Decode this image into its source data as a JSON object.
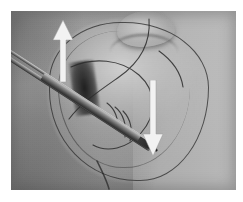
{
  "figure": {
    "kind": "clinical-surgical-photograph",
    "palette": "grayscale",
    "caption": "",
    "plate": {
      "border_color": "#ffffff",
      "x": 11,
      "y": 11,
      "width": 225,
      "height": 179
    }
  },
  "scene": {
    "subject": "breast",
    "view": "oblique intraoperative view",
    "background_label": "surgical drape",
    "regions": [
      {
        "name": "breast-mound",
        "tone": "#bdbdbd"
      },
      {
        "name": "nipple-areola",
        "tone": "#cecece"
      },
      {
        "name": "chest-wall-shadow",
        "tone": "#6e6e6e"
      },
      {
        "name": "axilla-shadow",
        "tone": "#656565"
      },
      {
        "name": "incision-pocket",
        "tone": "#1c1c1c"
      },
      {
        "name": "drape-right",
        "tone": "#bfbfbf"
      }
    ]
  },
  "instrument": {
    "name": "surgical-forceps",
    "label": "forceps",
    "orientation": "upper-left to lower-right diagonal",
    "angle_deg": 33,
    "metal_highlight": "#d8d8d8",
    "metal_shadow": "#282828"
  },
  "markings": {
    "flap_outline": {
      "name": "skin-marker-outline",
      "color": "#303030",
      "shape": "ellipse"
    },
    "sutures": {
      "name": "suture-threads",
      "color": "#2a2a2a",
      "count": 5
    }
  },
  "annotations": {
    "arrows": [
      {
        "id": "arrow-up",
        "name": "traction-arrow-up",
        "direction": "up",
        "color": "#f2f2f2",
        "x": 52,
        "y": 20,
        "width": 22,
        "height": 62,
        "label": ""
      },
      {
        "id": "arrow-down",
        "name": "traction-arrow-down",
        "direction": "down",
        "color": "#f2f2f2",
        "x": 142,
        "y": 80,
        "width": 22,
        "height": 76,
        "label": ""
      }
    ]
  }
}
